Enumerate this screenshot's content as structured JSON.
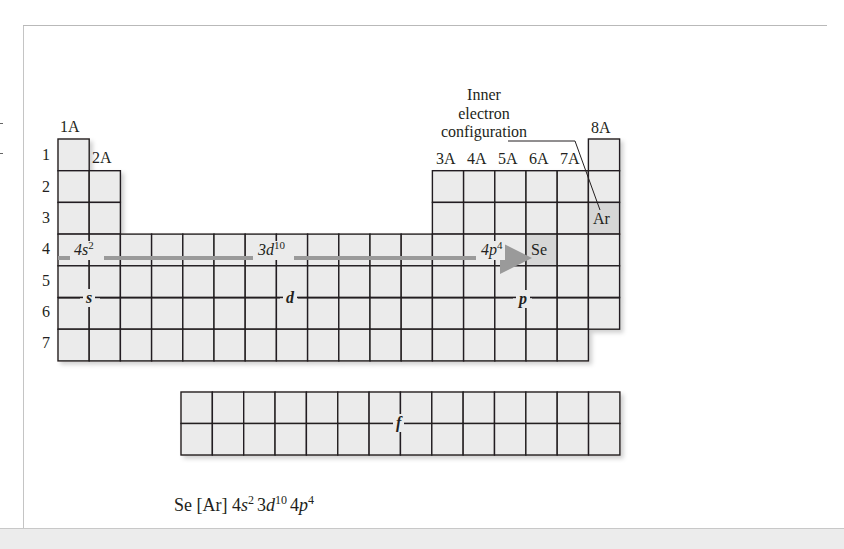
{
  "diagram": {
    "colors": {
      "cell_fill": "#ebebeb",
      "cell_border": "#231f20",
      "highlight_fill": "#d6d6d6",
      "arrow": "#9a9a9a",
      "text": "#231f20"
    },
    "group_labels": {
      "g1": "1A",
      "g2": "2A",
      "g13": "3A",
      "g14": "4A",
      "g15": "5A",
      "g16": "6A",
      "g17": "7A",
      "g18": "8A"
    },
    "period_labels": [
      "1",
      "2",
      "3",
      "4",
      "5",
      "6",
      "7"
    ],
    "block_labels": {
      "s": "s",
      "d": "d",
      "p": "p",
      "f": "f"
    },
    "row4_annotations": {
      "s_part": {
        "base": "4s",
        "sup": "2"
      },
      "d_part": {
        "base": "3d",
        "sup": "10"
      },
      "p_part": {
        "base": "4p",
        "sup": "4"
      }
    },
    "highlighted_cells": {
      "se": "Se",
      "ar": "Ar"
    },
    "callout": {
      "line1": "Inner",
      "line2": "electron",
      "line3": "configuration"
    },
    "caption": {
      "element": "Se",
      "core": "[Ar]",
      "terms": [
        {
          "n": "4",
          "l": "s",
          "e": "2"
        },
        {
          "n": "3",
          "l": "d",
          "e": "10"
        },
        {
          "n": "4",
          "l": "p",
          "e": "4"
        }
      ]
    }
  }
}
